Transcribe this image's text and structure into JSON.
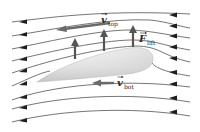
{
  "figure": {
    "type": "airfoil-lift-diagram",
    "colors": {
      "background": "#ffffff",
      "streamline": "#3a3a3a",
      "arrowhead": "#1e1e1e",
      "vector_arrow": "#6a6a6a",
      "airfoil_fill_light": "#f2f2f2",
      "airfoil_fill_dark": "#c8c8c8"
    },
    "labels": {
      "v_top": {
        "symbol": "v",
        "subscript": "top"
      },
      "v_bot": {
        "symbol": "v",
        "subscript": "bot"
      },
      "f_lift": {
        "symbol": "F",
        "subscript": "lift"
      }
    },
    "streamline_count": 9,
    "lift_arrow_count": 3,
    "flow_direction": "right-to-left"
  }
}
